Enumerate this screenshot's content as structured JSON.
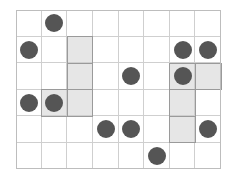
{
  "board": {
    "cols": 8,
    "rows": 6,
    "colors": {
      "grid_line": "#cfcfcf",
      "shaded": "#e6e6e6",
      "piece": "#555555",
      "background": "#ffffff"
    },
    "shaded_cells": [
      [
        2,
        1
      ],
      [
        2,
        2
      ],
      [
        2,
        3
      ],
      [
        1,
        3
      ],
      [
        6,
        2
      ],
      [
        7,
        2
      ],
      [
        6,
        3
      ],
      [
        6,
        4
      ]
    ],
    "pieces": [
      [
        1,
        0
      ],
      [
        0,
        1
      ],
      [
        6,
        1
      ],
      [
        7,
        1
      ],
      [
        4,
        2
      ],
      [
        6,
        2
      ],
      [
        0,
        3
      ],
      [
        1,
        3
      ],
      [
        3,
        4
      ],
      [
        4,
        4
      ],
      [
        7,
        4
      ],
      [
        5,
        5
      ]
    ]
  }
}
